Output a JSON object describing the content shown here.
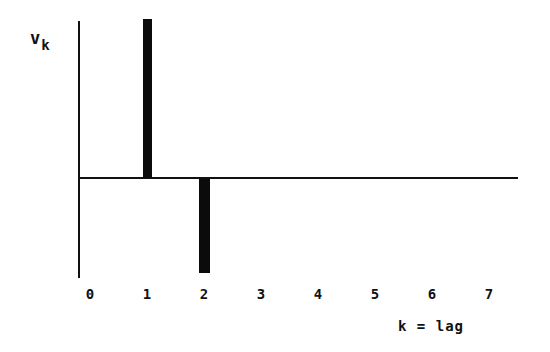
{
  "chart_data": {
    "type": "bar",
    "title": "",
    "subtitle": "",
    "xlabel": "k = lag",
    "ylabel": "v_k",
    "ylabel_base": "v",
    "ylabel_sub": "k",
    "categories": [
      "0",
      "1",
      "2",
      "3",
      "4",
      "5",
      "6",
      "7"
    ],
    "x": [
      0,
      1,
      2,
      3,
      4,
      5,
      6,
      7
    ],
    "values": [
      0,
      1.0,
      -0.59,
      0,
      0,
      0,
      0,
      0
    ],
    "tick_labels": [
      "0",
      "1",
      "2",
      "3",
      "4",
      "5",
      "6",
      "7"
    ],
    "xlim": [
      -0.2,
      7.6
    ],
    "ylim": [
      -0.62,
      1.05
    ],
    "grid": false,
    "legend": null,
    "bar_color": "#0b0b0b",
    "axis_color": "#111111",
    "background_color": "#ffffff",
    "annotations": [],
    "bars": [
      {
        "label": "1",
        "value": 1.0,
        "direction": "up"
      },
      {
        "label": "2",
        "value": -0.59,
        "direction": "down"
      }
    ]
  },
  "axes": {
    "y_axis_name": "vertical-axis-line",
    "x_axis_name": "horizontal-axis-line"
  }
}
